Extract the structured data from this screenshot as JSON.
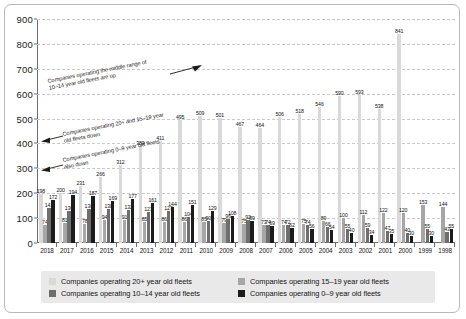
{
  "chart_data": {
    "type": "bar",
    "title": "",
    "xlabel": "",
    "ylabel": "",
    "ylim": [
      0,
      900
    ],
    "yticks": [
      0,
      100,
      200,
      300,
      400,
      500,
      600,
      700,
      800,
      900
    ],
    "grid": true,
    "legend_position": "bottom",
    "categories": [
      "2018",
      "2017",
      "2016",
      "2015",
      "2014",
      "2013",
      "2012",
      "2011",
      "2010",
      "2009",
      "2008",
      "2007",
      "2006",
      "2005",
      "2004",
      "2003",
      "2002",
      "2001",
      "2000",
      "1999",
      "1998"
    ],
    "series": [
      {
        "name": "Companies operating 20+ year old fleets",
        "color": "#d9d9d9",
        "values": [
          198,
          200,
          231,
          266,
          312,
          389,
          411,
          495,
          509,
          501,
          467,
          464,
          506,
          518,
          546,
          590,
          593,
          538,
          841,
          0,
          0
        ]
      },
      {
        "name": "Companies operating 15–19 year old fleets",
        "color": "#a6a6a6",
        "values": [
          74,
          81,
          78,
          94,
          91,
          85,
          86,
          86,
          85,
          79,
          75,
          73,
          74,
          75,
          89,
          100,
          112,
          122,
          120,
          153,
          144
        ]
      },
      {
        "name": "Companies operating 10–14 year old fleets",
        "color": "#6e6e6e",
        "values": [
          141,
          130,
          136,
          138,
          132,
          123,
          127,
          104,
          90,
          96,
          92,
          74,
          72,
          74,
          66,
          55,
          59,
          47,
          40,
          55,
          43
        ]
      },
      {
        "name": "Companies operating 0–9 year old fleets",
        "color": "#1c1c1c",
        "values": [
          172,
          194,
          187,
          169,
          177,
          161,
          144,
          151,
          129,
          108,
          89,
          69,
          62,
          56,
          54,
          40,
          34,
          35,
          30,
          30,
          55
        ]
      }
    ],
    "bar_value_labels": {
      "2018": [
        198,
        74,
        141,
        172
      ],
      "2017": [
        200,
        81,
        130,
        194
      ],
      "2016": [
        231,
        78,
        136,
        187
      ],
      "2015": [
        266,
        94,
        138,
        169
      ],
      "2014": [
        312,
        91,
        132,
        177
      ],
      "2013": [
        389,
        85,
        123,
        161
      ],
      "2012": [
        411,
        86,
        127,
        144
      ],
      "2011": [
        495,
        86,
        104,
        151
      ],
      "2010": [
        509,
        85,
        90,
        129
      ],
      "2009": [
        501,
        79,
        96,
        108
      ],
      "2008": [
        467,
        75,
        92,
        89
      ],
      "2007": [
        464,
        73,
        74,
        69
      ],
      "2006": [
        506,
        74,
        72,
        62
      ],
      "2005": [
        518,
        75,
        74,
        56
      ],
      "2004": [
        546,
        89,
        66,
        54
      ],
      "2003": [
        590,
        100,
        55,
        40
      ],
      "2002": [
        593,
        112,
        59,
        34
      ],
      "2001": [
        538,
        122,
        47,
        35
      ],
      "2000": [
        841,
        120,
        40,
        30
      ],
      "1999": [
        0,
        153,
        55,
        30
      ],
      "1998": [
        0,
        144,
        43,
        55
      ]
    },
    "annotations": [
      {
        "name": "annotation-middle-range-up",
        "line1": "Companies operating the middle range of",
        "line2": "10–14 year old fleets are up",
        "arrow": "right"
      },
      {
        "name": "annotation-old-fleets-down",
        "line1": "Companies operating 20+ and 15–19 year",
        "line2": "old fleets down",
        "arrow": "left"
      },
      {
        "name": "annotation-new-fleets-down",
        "line1": "Companies operating 0–9 year old fleets",
        "line2": "also down",
        "arrow": "left"
      }
    ]
  },
  "legend": {
    "items": [
      {
        "label": "Companies operating 20+ year old fleets",
        "color": "#d9d9d9"
      },
      {
        "label": "Companies operating 15–19 year old fleets",
        "color": "#a6a6a6"
      },
      {
        "label": "Companies operating 10–14 year old fleets",
        "color": "#6e6e6e"
      },
      {
        "label": "Companies operating 0–9 year old fleets",
        "color": "#1c1c1c"
      }
    ]
  }
}
